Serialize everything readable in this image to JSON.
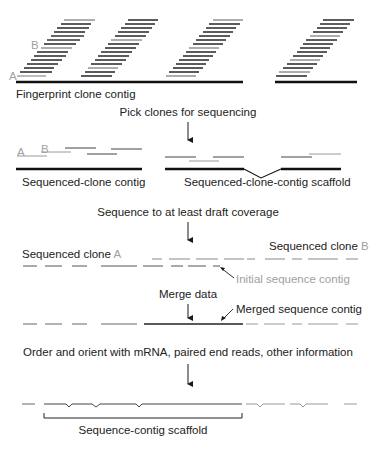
{
  "diagram": {
    "colors": {
      "dark": "#1a1a1a",
      "line": "#444444",
      "grey": "#9a9a9a",
      "light_grey": "#b8b8b8",
      "text": "#222222",
      "text_grey": "#a0a0a0"
    },
    "stage1": {
      "clone_labels": {
        "a": "A",
        "b": "B"
      },
      "caption": "Fingerprint clone contig"
    },
    "step1": {
      "label": "Pick clones for sequencing"
    },
    "stage2": {
      "clone_labels": {
        "a": "A",
        "b": "B"
      },
      "left_caption": "Sequenced-clone contig",
      "right_caption": "Sequenced-clone-contig scaffold"
    },
    "step2": {
      "label": "Sequence to at least draft coverage"
    },
    "stage3": {
      "clone_a_label": "Sequenced clone ",
      "clone_a_letter": "A",
      "clone_b_label": "Sequenced clone ",
      "clone_b_letter": "B",
      "callout": "Initial sequence contig"
    },
    "step3": {
      "label": "Merge data"
    },
    "stage4": {
      "callout": "Merged sequence contig"
    },
    "step4": {
      "label": "Order and orient with mRNA, paired end reads, other information"
    },
    "stage5": {
      "bracket_label": "Sequence-contig scaffold"
    }
  }
}
